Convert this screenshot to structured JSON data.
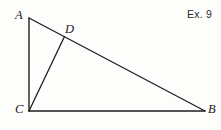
{
  "figure": {
    "caption": "Ex. 9",
    "background_color": "#fdfdfc",
    "stroke_color": "#1f1f1f",
    "stroke_width": 1.3,
    "width": 221,
    "height": 130,
    "labels": {
      "a": "A",
      "b": "B",
      "c": "C",
      "d": "D"
    },
    "points": {
      "A": {
        "x": 29,
        "y": 18
      },
      "B": {
        "x": 205,
        "y": 111
      },
      "C": {
        "x": 29,
        "y": 111
      },
      "D": {
        "x": 64,
        "y": 36
      }
    },
    "segments": [
      {
        "name": "side-AC",
        "from": "A",
        "to": "C"
      },
      {
        "name": "side-CB",
        "from": "C",
        "to": "B"
      },
      {
        "name": "side-AB",
        "from": "A",
        "to": "B"
      },
      {
        "name": "cevian-CD",
        "from": "C",
        "to": "D"
      }
    ]
  }
}
